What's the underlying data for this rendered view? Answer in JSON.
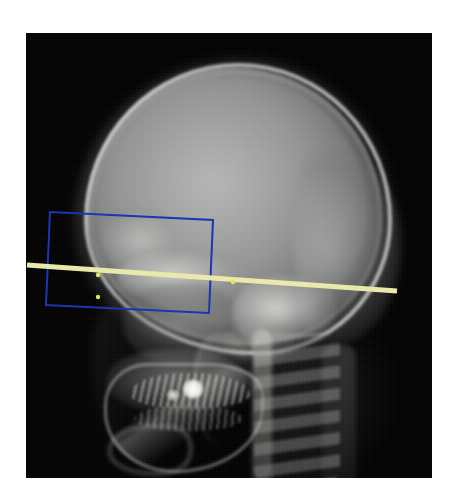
{
  "viewer": {
    "label": "radiograph-viewer",
    "background_color": "#ffffff"
  },
  "image": {
    "name": "lateral-cephalometric-skull-radiograph",
    "modality_label": "X-ray",
    "film_color": "#000000",
    "frame": {
      "x": 26,
      "y": 33,
      "width": 406,
      "height": 445
    }
  },
  "anatomy": [
    {
      "id": "calvarium",
      "label": "cranial vault"
    },
    {
      "id": "frontal",
      "label": "frontal bone / frontal sinus"
    },
    {
      "id": "sphenoid",
      "label": "sphenoid / orbital roof"
    },
    {
      "id": "petrous",
      "label": "petrous temporal bone"
    },
    {
      "id": "maxilla",
      "label": "maxilla"
    },
    {
      "id": "mandible",
      "label": "mandible"
    },
    {
      "id": "dental-arch",
      "label": "dental arch"
    },
    {
      "id": "restoration",
      "label": "dental restoration"
    },
    {
      "id": "spine",
      "label": "cervical spine"
    },
    {
      "id": "occiput",
      "label": "occipital bone"
    }
  ],
  "annotations": {
    "roi_rectangle": {
      "name": "region-of-interest-box",
      "color": "#1c35b4",
      "stroke_width": 2,
      "rotation_degrees": 2.8,
      "points": [
        {
          "x": 50,
          "y": 212
        },
        {
          "x": 213,
          "y": 220
        },
        {
          "x": 209,
          "y": 313
        },
        {
          "x": 46,
          "y": 305
        }
      ]
    },
    "reference_line": {
      "name": "cephalometric-reference-line",
      "color": "#e9e9ab",
      "stroke_width": 5,
      "start": {
        "x": 27,
        "y": 265
      },
      "end": {
        "x": 397,
        "y": 291
      }
    },
    "landmarks": [
      {
        "name": "landmark-point-1",
        "x": 98,
        "y": 275,
        "color": "#e8e84e"
      },
      {
        "name": "landmark-point-2",
        "x": 98,
        "y": 297,
        "color": "#e8e84e"
      },
      {
        "name": "landmark-point-3",
        "x": 233,
        "y": 282,
        "color": "#e8e84e"
      }
    ]
  }
}
